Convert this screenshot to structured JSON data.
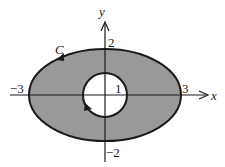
{
  "diagram": {
    "axes": {
      "x_label": "x",
      "y_label": "y"
    },
    "ticks": {
      "x_pos": "3",
      "x_neg": "−3",
      "y_pos": "2",
      "y_neg": "−2",
      "inner_radius": "1"
    },
    "curve_label": "C",
    "regions": {
      "outer": "ellipse x^2/9 + y^2/4 = 1",
      "inner": "circle x^2 + y^2 = 1",
      "shaded": "region between ellipse and circle"
    },
    "colors": {
      "fill": "#999999",
      "stroke": "#1a1a1a",
      "hole": "#ffffff"
    }
  }
}
